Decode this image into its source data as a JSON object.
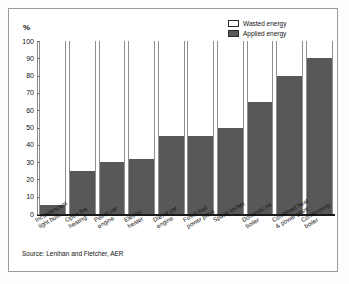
{
  "chart_data": {
    "type": "bar",
    "title": "",
    "subtitle": "",
    "xlabel": "",
    "ylabel": "%",
    "ylim": [
      0,
      100
    ],
    "ytick_step": 10,
    "yticks": [
      "100",
      "90",
      "80",
      "70",
      "60",
      "50",
      "40",
      "30",
      "20",
      "10",
      "0"
    ],
    "grid": false,
    "stacked": true,
    "legend_position": "top-right",
    "legend": [
      "Wasted energy",
      "Applied energy"
    ],
    "categories": [
      "Incandescent light bulb",
      "Open fire heating",
      "Petrol car engine",
      "Electric heater",
      "Diesel car engine",
      "Fossil fuel power plant",
      "Space rocket",
      "Domestic oil boiler",
      "Combined heat & power plant",
      "Condensing boiler"
    ],
    "categories_wrapped": [
      [
        "Incandescent",
        "light bulb"
      ],
      [
        "Open fire",
        "heating"
      ],
      [
        "Petrol car",
        "engine"
      ],
      [
        "Electric",
        "heater"
      ],
      [
        "Diesel car",
        "engine"
      ],
      [
        "Fossil fuel",
        "power plant"
      ],
      [
        "Space rocket",
        ""
      ],
      [
        "Domestic oil",
        "boiler"
      ],
      [
        "Combined heat",
        "& power plant"
      ],
      [
        "Condensing",
        "boiler"
      ]
    ],
    "series": [
      {
        "name": "Applied energy",
        "color": "#585858",
        "values": [
          5,
          25,
          30,
          32,
          45,
          45,
          50,
          65,
          80,
          90
        ]
      },
      {
        "name": "Wasted energy",
        "color": "#ffffff",
        "values": [
          95,
          75,
          70,
          68,
          55,
          55,
          50,
          35,
          20,
          10
        ]
      }
    ],
    "source": "Source: Lenihan and Fletcher, AER"
  },
  "colors": {
    "applied": "#585858",
    "wasted": "#ffffff",
    "axis": "#1a1a1a",
    "frame": "#9a9a9a",
    "text": "#111111"
  }
}
